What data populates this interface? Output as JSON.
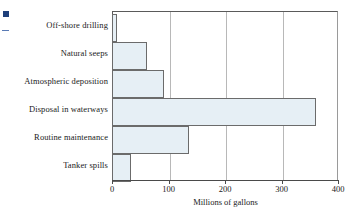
{
  "chart_data": {
    "type": "bar",
    "orientation": "horizontal",
    "title": "",
    "xlabel": "Millions of gallons",
    "ylabel": "",
    "categories": [
      "Off-shore drilling",
      "Natural seeps",
      "Atmospheric deposition",
      "Disposal in waterways",
      "Routine maintenance",
      "Tanker spills"
    ],
    "values": [
      8,
      62,
      92,
      361,
      137,
      34
    ],
    "xlim": [
      0,
      400
    ],
    "xticks": [
      0,
      100,
      200,
      300,
      400
    ],
    "xtick_labels": [
      "0",
      "100",
      "200",
      "300",
      "400"
    ],
    "grid": "vertical gridlines at 100, 200, 300",
    "legend": "none",
    "bar_fill_color": "#e6eff5",
    "bar_border_color": "#6b6b6b",
    "axis_color": "#4a4a4a",
    "gridline_color": "#b8b8b8"
  },
  "marks": {
    "corner_square_color": "#1f3f7a",
    "corner_dash_color": "#5a7bb5"
  }
}
